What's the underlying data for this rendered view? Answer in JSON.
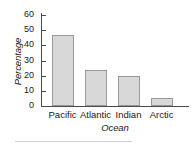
{
  "chart_data": {
    "type": "bar",
    "title": "",
    "xlabel": "Ocean",
    "ylabel": "Percentage",
    "categories": [
      "Pacific",
      "Atlantic",
      "Indian",
      "Arctic"
    ],
    "values": [
      47,
      23.5,
      20,
      5
    ],
    "ylim": [
      0,
      60
    ],
    "yticks": [
      0,
      10,
      20,
      30,
      40,
      50,
      60
    ],
    "ytick_labels": [
      "0",
      "10",
      "20",
      "30",
      "40",
      "50",
      "60"
    ],
    "grid": false,
    "legend": false,
    "bar_fill_color": "#d8d8d8",
    "bar_border_color": "#9a9a9a",
    "axis_color": "#4a4a4a",
    "text_color": "#1a1a1a",
    "background_color": "#ffffff",
    "footer_rule_color": "#d2d2d2"
  }
}
